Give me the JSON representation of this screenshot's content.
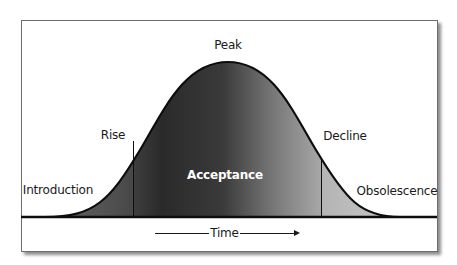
{
  "diagram": {
    "type": "product-life-cycle-bell-curve",
    "stages": [
      {
        "id": "introduction",
        "label": "Introduction"
      },
      {
        "id": "rise",
        "label": "Rise"
      },
      {
        "id": "peak",
        "label": "Peak"
      },
      {
        "id": "acceptance",
        "label": "Acceptance"
      },
      {
        "id": "decline",
        "label": "Decline"
      },
      {
        "id": "obsolescence",
        "label": "Obsolescence"
      }
    ],
    "axis": {
      "label": "Time",
      "direction": "left-to-right"
    },
    "regions": [
      {
        "name": "introduction-region",
        "color": "#5a5a5a"
      },
      {
        "name": "acceptance-region",
        "color": "#2e2e2e"
      },
      {
        "name": "obsolescence-region",
        "color": "#b8b8b8"
      }
    ],
    "colors": {
      "curve_stroke": "#0d0d0d",
      "fill_dark": "#2a2a2a",
      "fill_light": "#c4c4c4",
      "frame_border": "#6e6e6e",
      "text": "#1a1a1a",
      "accent_text": "#ffffff"
    }
  }
}
